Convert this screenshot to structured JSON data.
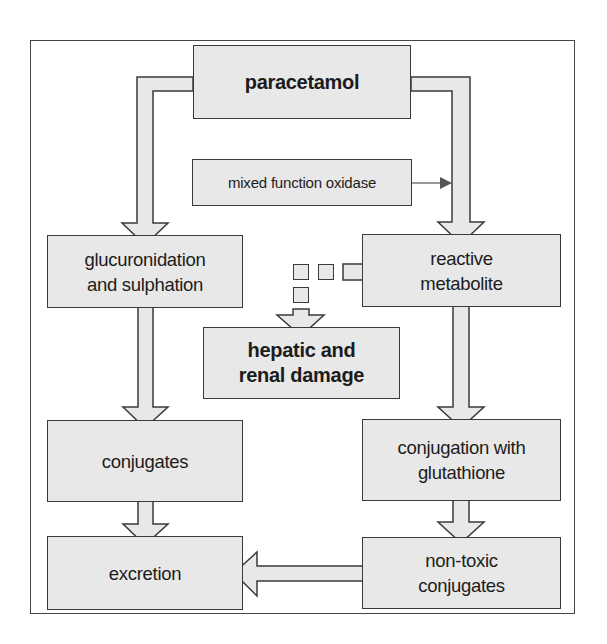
{
  "diagram": {
    "colors": {
      "box_fill": "#e8e8e8",
      "box_stroke": "#3a3a3a",
      "frame_stroke": "#444444",
      "connector": "#555555"
    },
    "nodes": {
      "paracetamol": "paracetamol",
      "mixed_function_oxidase": "mixed function oxidase",
      "glucuronidation_line1": "glucuronidation",
      "glucuronidation_line2": "and sulphation",
      "reactive_line1": "reactive",
      "reactive_line2": "metabolite",
      "damage_line1": "hepatic and",
      "damage_line2": "renal damage",
      "conjugates": "conjugates",
      "conjugation_line1": "conjugation with",
      "conjugation_line2": "glutathione",
      "excretion": "excretion",
      "nontoxic_line1": "non-toxic",
      "nontoxic_line2": "conjugates"
    },
    "edges": [
      {
        "from": "paracetamol",
        "to": "glucuronidation and sulphation",
        "style": "block-arrow"
      },
      {
        "from": "paracetamol",
        "to": "reactive metabolite",
        "style": "block-arrow"
      },
      {
        "from": "mixed function oxidase",
        "to": "paracetamol→reactive metabolite path",
        "style": "thin-arrow"
      },
      {
        "from": "reactive metabolite",
        "to": "hepatic and renal damage",
        "style": "dashed-block-arrow"
      },
      {
        "from": "glucuronidation and sulphation",
        "to": "conjugates",
        "style": "block-arrow"
      },
      {
        "from": "reactive metabolite",
        "to": "conjugation with glutathione",
        "style": "block-arrow"
      },
      {
        "from": "conjugates",
        "to": "excretion",
        "style": "block-arrow"
      },
      {
        "from": "conjugation with glutathione",
        "to": "non-toxic conjugates",
        "style": "block-arrow"
      },
      {
        "from": "non-toxic conjugates",
        "to": "excretion",
        "style": "block-arrow"
      }
    ]
  }
}
